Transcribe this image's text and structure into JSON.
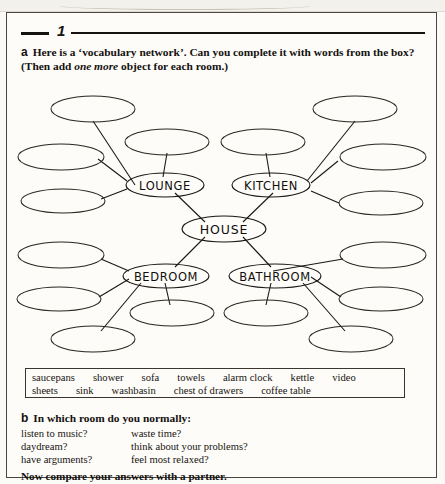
{
  "exercise": {
    "number": "1"
  },
  "task_a": {
    "letter": "a",
    "text_part1": "Here is a ‘vocabulary network’. Can you complete it with words from the box? (Then add ",
    "emphasis": "one more",
    "text_part2": " object for each room.)"
  },
  "diagram": {
    "center": {
      "label": "HOUSE"
    },
    "rooms": [
      {
        "label": "LOUNGE"
      },
      {
        "label": "KITCHEN"
      },
      {
        "label": "BEDROOM"
      },
      {
        "label": "BATHROOM"
      }
    ],
    "blank_count": 16
  },
  "word_box": {
    "row1": [
      "saucepans",
      "shower",
      "sofa",
      "towels",
      "alarm clock",
      "kettle",
      "video"
    ],
    "row2": [
      "sheets",
      "sink",
      "washbasin",
      "chest of drawers",
      "coffee table"
    ]
  },
  "task_b": {
    "letter": "b",
    "text": "In which room do you normally:",
    "questions_left": [
      "listen to music?",
      "daydream?",
      "have arguments?"
    ],
    "questions_right": [
      "waste time?",
      "think about your problems?",
      "feel most relaxed?"
    ]
  },
  "closing": "Now compare your answers with a partner.",
  "colors": {
    "ink": "#15120f",
    "paper": "#fdfcf9",
    "rule": "#15120f"
  }
}
